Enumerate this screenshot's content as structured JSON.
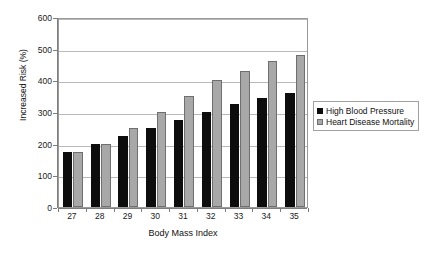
{
  "chart_data": {
    "type": "bar",
    "title": "",
    "xlabel": "Body Mass Index",
    "ylabel": "Increased Risk (%)",
    "categories": [
      "27",
      "28",
      "29",
      "30",
      "31",
      "32",
      "33",
      "34",
      "35"
    ],
    "series": [
      {
        "name": "High Blood Pressure",
        "color": "#0d0d0d",
        "values": [
          175,
          200,
          225,
          250,
          275,
          300,
          325,
          345,
          360
        ]
      },
      {
        "name": "Heart Disease Mortality",
        "color": "#a8a8a8",
        "values": [
          175,
          200,
          250,
          300,
          350,
          400,
          430,
          460,
          480
        ]
      }
    ],
    "ylim": [
      0,
      600
    ],
    "ytick_values": [
      0,
      100,
      200,
      300,
      400,
      500,
      600
    ],
    "ytick_labels": [
      "0",
      "100",
      "200",
      "300",
      "400",
      "500",
      "600"
    ],
    "grid": true,
    "legend_position": "right"
  }
}
